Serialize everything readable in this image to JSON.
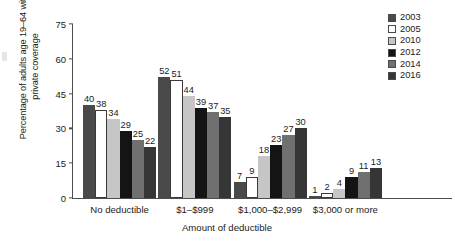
{
  "chart_data": {
    "type": "bar",
    "title": "",
    "xlabel": "Amount of deductible",
    "ylabel": "Percentage of adults age 19–64 with\nprivate coverage",
    "categories": [
      "No deductible",
      "$1–$999",
      "$1,000–$2,999",
      "$3,000 or more"
    ],
    "series": [
      {
        "name": "2003",
        "color": "#4a4a4a",
        "values": [
          40,
          52,
          7,
          1
        ]
      },
      {
        "name": "2005",
        "color": "#ffffff",
        "values": [
          38,
          51,
          9,
          2
        ]
      },
      {
        "name": "2010",
        "color": "#c6c6c6",
        "values": [
          34,
          44,
          18,
          4
        ]
      },
      {
        "name": "2012",
        "color": "#141414",
        "values": [
          29,
          39,
          23,
          9
        ]
      },
      {
        "name": "2014",
        "color": "#707070",
        "values": [
          25,
          37,
          27,
          11
        ]
      },
      {
        "name": "2016",
        "color": "#363636",
        "values": [
          22,
          35,
          30,
          13
        ]
      }
    ],
    "ylim": [
      0,
      75
    ],
    "yticks": [
      0,
      15,
      30,
      45,
      60,
      75
    ],
    "grid": false,
    "legend_position": "top-right",
    "legend_entries": [
      "2003",
      "2005",
      "2010",
      "2012",
      "2014",
      "2016"
    ]
  }
}
